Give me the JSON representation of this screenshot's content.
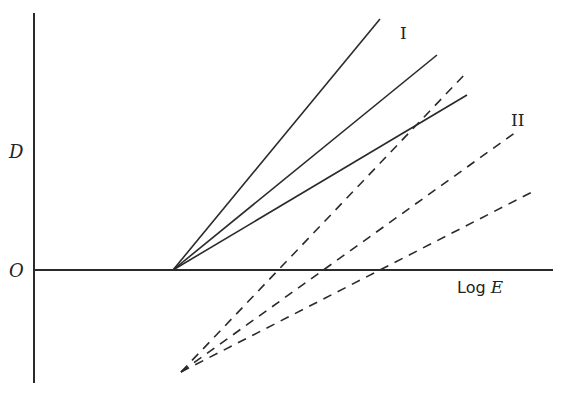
{
  "diagram": {
    "type": "characteristic-curves",
    "axes": {
      "y_label": "D",
      "origin_label": "O",
      "x_label_prefix": "Log ",
      "x_label_var": "E",
      "y_axis": {
        "x": 34,
        "y_top": 13,
        "y_bottom": 383
      },
      "x_axis": {
        "y": 270,
        "x_start": 34,
        "x_end": 553
      }
    },
    "groups": [
      {
        "label": "I",
        "style": "solid",
        "label_pos": {
          "x": 400,
          "y": 39
        },
        "origin": {
          "x": 173,
          "y": 270
        },
        "lines": [
          {
            "x2": 380,
            "y2": 19
          },
          {
            "x2": 437,
            "y2": 55
          },
          {
            "x2": 467,
            "y2": 95
          }
        ]
      },
      {
        "label": "II",
        "style": "dashed",
        "label_pos": {
          "x": 511,
          "y": 126
        },
        "origin": {
          "x": 181,
          "y": 372
        },
        "lines": [
          {
            "x2": 467,
            "y2": 72
          },
          {
            "x2": 516,
            "y2": 132
          },
          {
            "x2": 536,
            "y2": 190
          }
        ]
      }
    ],
    "colors": {
      "stroke": "#2a2a2a",
      "background": "#ffffff"
    }
  }
}
